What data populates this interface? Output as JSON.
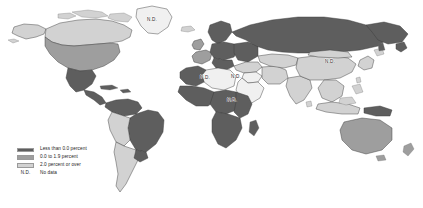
{
  "figure": {
    "background_color": "#ffffff",
    "width": 423,
    "height": 208
  },
  "legend": {
    "nd_abbrev": "N.D.",
    "rows": [
      {
        "label": "Less than 0.0 percent",
        "color": "#5e5e5e",
        "swatch": true
      },
      {
        "label": "0.0 to 1.9 percent",
        "color": "#9e9e9e",
        "swatch": true
      },
      {
        "label": "2.0 percent or over",
        "color": "#d2d2d2",
        "swatch": true
      },
      {
        "label": "No data",
        "color": "#f2f2f2",
        "swatch": false
      }
    ]
  },
  "map": {
    "ocean_color": "#ffffff",
    "border_color": "#3a3a3a",
    "no_data_color": "#f0f0f0",
    "class_colors": {
      "negative": "#5e5e5e",
      "low": "#9e9e9e",
      "high": "#d2d2d2",
      "nodata": "#f0f0f0"
    },
    "nd_labels": [
      {
        "text": "N.D.",
        "x": 152,
        "y": 20,
        "region": "greenland"
      },
      {
        "text": "N.D.",
        "x": 205,
        "y": 78,
        "region": "north-africa"
      },
      {
        "text": "N.D.",
        "x": 236,
        "y": 77,
        "region": "arabian-peninsula"
      },
      {
        "text": "N.D.",
        "x": 232,
        "y": 101,
        "region": "horn-of-africa"
      },
      {
        "text": "N.D.",
        "x": 330,
        "y": 62,
        "region": "east-asia"
      }
    ]
  }
}
